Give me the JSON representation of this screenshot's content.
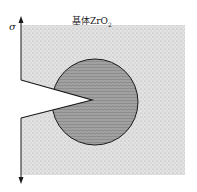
{
  "diagram": {
    "matrix_label_prefix": "基体ZrO",
    "matrix_label_sub": "2",
    "stress_symbol": "σ",
    "colors": {
      "matrix": "#d8d8d8",
      "particle": "#9a9a9a",
      "line": "#1a1a1a"
    }
  }
}
